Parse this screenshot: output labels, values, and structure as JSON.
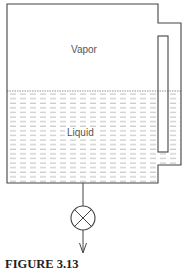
{
  "figure": {
    "caption": "FIGURE 3.13",
    "labels": {
      "vapor": "Vapor",
      "liquid": "Liquid"
    },
    "components": [
      "tank",
      "liquid-level-sight-tube",
      "drain-pipe",
      "valve-icon",
      "flow-arrow"
    ]
  },
  "colors": {
    "line": "#444444",
    "hatch": "#9a9a9a",
    "text": "#555555"
  }
}
